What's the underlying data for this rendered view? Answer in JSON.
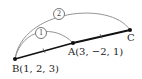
{
  "diagram": {
    "points": {
      "A": {
        "label": "A(3,  −2,  1)",
        "name": "A",
        "coords": [
          3,
          -2,
          1
        ]
      },
      "B": {
        "label": "B(1,  2,  3)",
        "name": "B",
        "coords": [
          1,
          2,
          3
        ]
      },
      "C": {
        "label": "C",
        "name": "C"
      }
    },
    "arcs": [
      {
        "id": "1",
        "label": "1",
        "from": "B",
        "to": "A"
      },
      {
        "id": "2",
        "label": "2",
        "from": "B",
        "to": "C"
      }
    ],
    "segments": [
      {
        "from": "B",
        "to": "A",
        "tick": 1
      },
      {
        "from": "A",
        "to": "C",
        "tick": 1
      }
    ],
    "colors": {
      "line": "#111111",
      "arc": "#888888"
    }
  }
}
